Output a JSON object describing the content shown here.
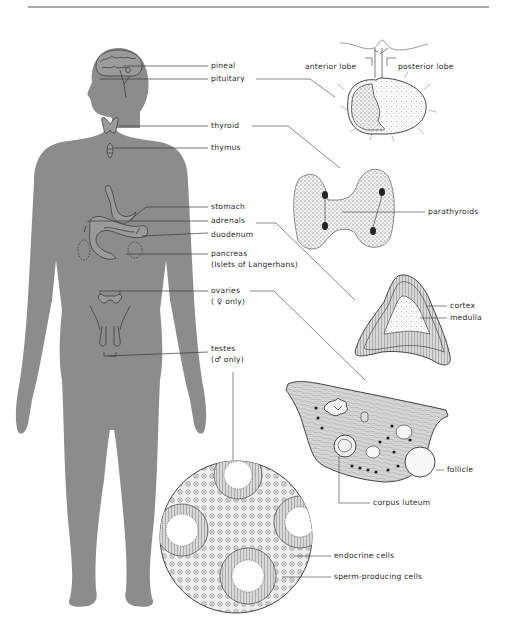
{
  "diagram": {
    "type": "anatomical-endocrine-system",
    "colors": {
      "silhouette": "#8c8c8c",
      "line": "#3a3a3a",
      "text": "#2a2a2a",
      "rule": "#555555",
      "background": "#ffffff"
    },
    "body_labels": {
      "pineal": "pineal",
      "pituitary": "pituitary",
      "thyroid": "thyroid",
      "thymus": "thymus",
      "stomach": "stomach",
      "adrenals": "adrenals",
      "duodenum": "duodenum",
      "pancreas": "pancreas",
      "pancreas_sub": "(Islets of Langerhans)",
      "ovaries": "ovaries",
      "ovaries_sub": "( ♀ only)",
      "testes": "testes",
      "testes_sub": "(♂ only)"
    },
    "detail_labels": {
      "pituitary_anterior": "anterior lobe",
      "pituitary_posterior": "posterior lobe",
      "parathyroids": "parathyroids",
      "adrenal_cortex": "cortex",
      "adrenal_medulla": "medulla",
      "ovary_follicle": "follicle",
      "ovary_corpus_luteum": "corpus luteum",
      "testis_endocrine": "endocrine cells",
      "testis_sperm": "sperm-producing cells"
    }
  }
}
